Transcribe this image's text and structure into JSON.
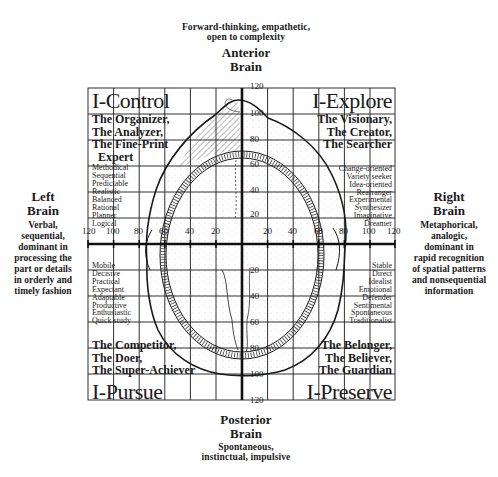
{
  "top": {
    "description": [
      "Forward-thinking, empathetic,",
      "open to complexity"
    ],
    "title": [
      "Anterior",
      "Brain"
    ]
  },
  "bottom": {
    "title": [
      "Posterior",
      "Brain"
    ],
    "description": [
      "Spontaneous,",
      "instinctual, impulsive"
    ]
  },
  "left": {
    "title": [
      "Left",
      "Brain"
    ],
    "description": [
      "Verbal,",
      "sequential,",
      "dominant in",
      "processing the",
      "part or details",
      "in orderly and",
      "timely fashion"
    ]
  },
  "right": {
    "title": [
      "Right",
      "Brain"
    ],
    "description": [
      "Metaphorical,",
      "analogic,",
      "dominant in",
      "rapid recognition",
      "of spatial patterns",
      "and nonsequential",
      "information"
    ]
  },
  "quadrants": {
    "top_left": {
      "title": "I-Control",
      "roles": [
        "The Organizer,",
        "The Analyzer,",
        "The Fine-Print",
        "Expert"
      ],
      "traits": [
        "Methodical",
        "Sequential",
        "Predictable",
        "Realistic",
        "Balanced",
        "Rational",
        "Planner",
        "Logical"
      ]
    },
    "top_right": {
      "title": "I-Explore",
      "roles": [
        "The Visionary,",
        "The Creator,",
        "The Searcher"
      ],
      "traits": [
        "Change-oriented",
        "Variety seeker",
        "Idea-oriented",
        "Rearranger",
        "Experimental",
        "Synthesizer",
        "Imaginative",
        "Dreamer"
      ]
    },
    "bottom_left": {
      "title": "I-Pursue",
      "roles": [
        "The Competitor,",
        "The Doer,",
        "The Super-Achiever"
      ],
      "traits": [
        "Mobile",
        "Decisive",
        "Practical",
        "Expectant",
        "Adaptable",
        "Productive",
        "Enthusiastic",
        "Quick study"
      ]
    },
    "bottom_right": {
      "title": "I-Preserve",
      "roles": [
        "The Belonger,",
        "The Believer,",
        "The Guardian"
      ],
      "traits": [
        "Stable",
        "Direct",
        "Idealist",
        "Emotional",
        "Defender",
        "Sentimental",
        "Spontaneous",
        "Traditionalist"
      ]
    }
  },
  "axes": {
    "x_ticks_left": [
      "120",
      "100",
      "80",
      "60",
      "40",
      "20"
    ],
    "x_ticks_right": [
      "20",
      "40",
      "60",
      "80",
      "100",
      "120"
    ],
    "y_ticks_top": [
      "120",
      "100",
      "80",
      "60",
      "40",
      "20"
    ],
    "y_ticks_bottom": [
      "20",
      "40",
      "60",
      "80",
      "100",
      "120"
    ]
  },
  "colors": {
    "ink": "#1a1a1a",
    "background": "#ffffff"
  }
}
